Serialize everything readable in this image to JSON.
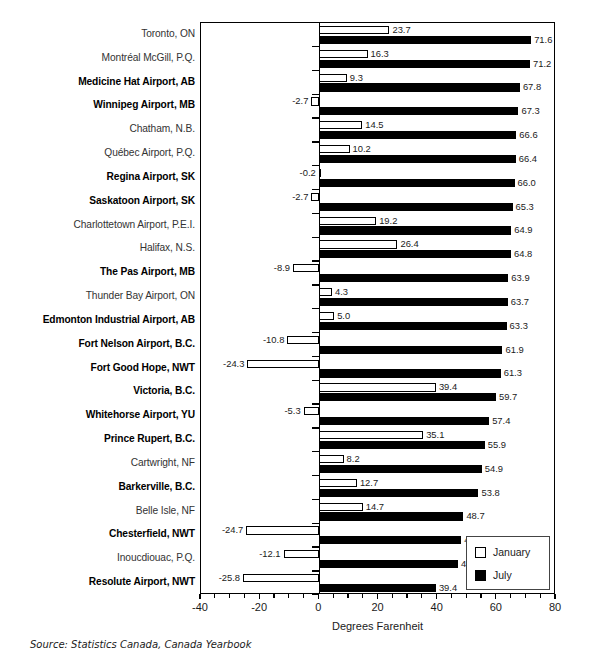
{
  "chart_data": {
    "type": "bar",
    "orientation": "horizontal",
    "title": "",
    "xlabel": "Degrees Farenheit",
    "ylabel": "",
    "xlim": [
      -40,
      80
    ],
    "xticks": [
      -40,
      -20,
      0,
      20,
      40,
      60,
      80
    ],
    "xtick_labels": [
      "-40",
      "-20",
      "0",
      "20",
      "40",
      "60",
      "80"
    ],
    "grid": false,
    "legend_position": "bottom-right",
    "categories": [
      "Toronto, ON",
      "Montréal McGill, P.Q.",
      "Medicine Hat Airport, AB",
      "Winnipeg Airport, MB",
      "Chatham, N.B.",
      "Québec Airport, P.Q.",
      "Regina Airport, SK",
      "Saskatoon Airport, SK",
      "Charlottetown Airport, P.E.I.",
      "Halifax, N.S.",
      "The Pas Airport, MB",
      "Thunder Bay Airport, ON",
      "Edmonton Industrial Airport, AB",
      "Fort Nelson Airport, B.C.",
      "Fort Good Hope, NWT",
      "Victoria, B.C.",
      "Whitehorse Airport, YU",
      "Prince Rupert, B.C.",
      "Cartwright, NF",
      "Barkerville, B.C.",
      "Belle Isle, NF",
      "Chesterfield, NWT",
      "Inoucdiouac, P.Q.",
      "Resolute Airport, NWT"
    ],
    "category_emphasis": [
      false,
      false,
      true,
      true,
      false,
      false,
      true,
      true,
      false,
      false,
      true,
      false,
      true,
      true,
      true,
      true,
      true,
      true,
      false,
      true,
      false,
      true,
      false,
      true
    ],
    "series": [
      {
        "name": "January",
        "color": "#ffffff",
        "edge_color": "#000000",
        "values": [
          23.7,
          16.3,
          9.3,
          -2.7,
          14.5,
          10.2,
          -0.2,
          -2.7,
          19.2,
          26.4,
          -8.9,
          4.3,
          5.0,
          -10.8,
          -24.3,
          39.4,
          -5.3,
          35.1,
          8.2,
          12.7,
          14.7,
          -24.7,
          -12.1,
          -25.8
        ],
        "value_labels": [
          "23.7",
          "16.3",
          "9.3",
          "-2.7",
          "14.5",
          "10.2",
          "-0.2",
          "-2.7",
          "19.2",
          "26.4",
          "-8.9",
          "4.3",
          "5.0",
          "-10.8",
          "-24.3",
          "39.4",
          "-5.3",
          "35.1",
          "8.2",
          "12.7",
          "14.7",
          "-24.7",
          "-12.1",
          "-25.8"
        ]
      },
      {
        "name": "July",
        "color": "#000000",
        "edge_color": "#000000",
        "values": [
          71.6,
          71.2,
          67.8,
          67.3,
          66.6,
          66.4,
          66.0,
          65.3,
          64.9,
          64.8,
          63.9,
          63.7,
          63.3,
          61.9,
          61.3,
          59.7,
          57.4,
          55.9,
          54.9,
          53.8,
          48.7,
          48.0,
          46.9,
          39.4
        ],
        "value_labels": [
          "71.6",
          "71.2",
          "67.8",
          "67.3",
          "66.6",
          "66.4",
          "66.0",
          "65.3",
          "64.9",
          "64.8",
          "63.9",
          "63.7",
          "63.3",
          "61.9",
          "61.3",
          "59.7",
          "57.4",
          "55.9",
          "54.9",
          "53.8",
          "48.7",
          "48.0",
          "46.9",
          "39.4"
        ]
      }
    ]
  },
  "legend": {
    "items": [
      {
        "label": "January",
        "swatch": "white-square"
      },
      {
        "label": "July",
        "swatch": "black-square"
      }
    ]
  },
  "axis": {
    "x_title": "Degrees Farenheit"
  },
  "source": {
    "text": "Source: Statistics Canada, Canada Yearbook"
  }
}
